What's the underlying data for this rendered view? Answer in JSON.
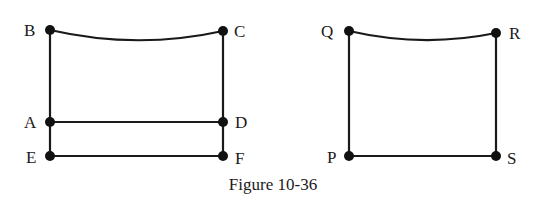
{
  "figure": {
    "caption": "Figure 10-36",
    "left_graph": {
      "vertices": [
        {
          "id": "B",
          "label": "B",
          "x": 50,
          "y": 30
        },
        {
          "id": "C",
          "label": "C",
          "x": 223,
          "y": 31
        },
        {
          "id": "A",
          "label": "A",
          "x": 50,
          "y": 122
        },
        {
          "id": "D",
          "label": "D",
          "x": 223,
          "y": 122
        },
        {
          "id": "E",
          "label": "E",
          "x": 50,
          "y": 156
        },
        {
          "id": "F",
          "label": "F",
          "x": 223,
          "y": 156
        }
      ],
      "edges": [
        {
          "from": "B",
          "to": "C",
          "curved": true
        },
        {
          "from": "B",
          "to": "A"
        },
        {
          "from": "C",
          "to": "D"
        },
        {
          "from": "A",
          "to": "D"
        },
        {
          "from": "A",
          "to": "E"
        },
        {
          "from": "D",
          "to": "F"
        },
        {
          "from": "E",
          "to": "F"
        }
      ]
    },
    "right_graph": {
      "vertices": [
        {
          "id": "Q",
          "label": "Q",
          "x": 349,
          "y": 31
        },
        {
          "id": "R",
          "label": "R",
          "x": 496,
          "y": 33
        },
        {
          "id": "P",
          "label": "P",
          "x": 349,
          "y": 156
        },
        {
          "id": "S",
          "label": "S",
          "x": 496,
          "y": 156
        }
      ],
      "edges": [
        {
          "from": "Q",
          "to": "R",
          "curved": true
        },
        {
          "from": "Q",
          "to": "P"
        },
        {
          "from": "R",
          "to": "S"
        },
        {
          "from": "P",
          "to": "S"
        }
      ]
    }
  }
}
